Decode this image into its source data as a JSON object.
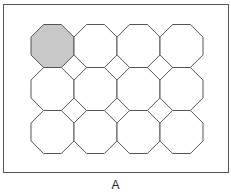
{
  "figure": {
    "caption": "A",
    "grid": {
      "rows": 3,
      "cols": 4,
      "origin_x": 31,
      "origin_y": 24.5,
      "pitch": 43,
      "size": 43
    },
    "highlighted_cell": {
      "row": 0,
      "col": 0,
      "fill": "#c8c8c8"
    },
    "colors": {
      "stroke": "#555555",
      "fill": "#ffffff",
      "highlight": "#c8c8c8"
    }
  }
}
